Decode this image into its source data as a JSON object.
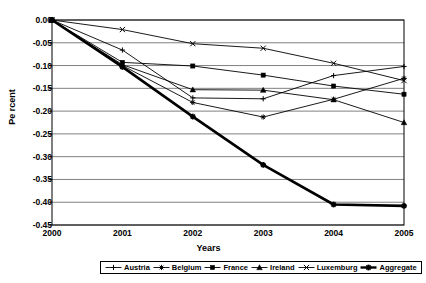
{
  "chart_data": {
    "type": "line",
    "title": "",
    "xlabel": "Years",
    "ylabel": "Pe rcent",
    "categories": [
      "2000",
      "2001",
      "2002",
      "2003",
      "2004",
      "2005"
    ],
    "x": [
      2000,
      2001,
      2002,
      2003,
      2004,
      2005
    ],
    "ylim": [
      -0.45,
      0.0
    ],
    "xlim": [
      2000,
      2005
    ],
    "ytick_labels": [
      "0.00",
      "-0.05",
      "-0.10",
      "-0.15",
      "-0.20",
      "-0.25",
      "-0.30",
      "-0.35",
      "-0.40",
      "-0.45"
    ],
    "ytick_values": [
      0.0,
      -0.05,
      -0.1,
      -0.15,
      -0.2,
      -0.25,
      -0.3,
      -0.35,
      -0.4,
      -0.45
    ],
    "grid": "horizontal",
    "legend_position": "bottom",
    "series": [
      {
        "name": "Austria",
        "marker": "plus",
        "values": [
          0.0,
          -0.066,
          -0.171,
          -0.173,
          -0.122,
          -0.102
        ]
      },
      {
        "name": "Belgium",
        "marker": "asterisk",
        "values": [
          0.0,
          -0.1,
          -0.181,
          -0.213,
          -0.174,
          -0.128
        ]
      },
      {
        "name": "France",
        "marker": "square",
        "values": [
          0.0,
          -0.093,
          -0.101,
          -0.121,
          -0.145,
          -0.163
        ]
      },
      {
        "name": "Ireland",
        "marker": "triangle",
        "values": [
          0.0,
          -0.098,
          -0.153,
          -0.154,
          -0.175,
          -0.225
        ]
      },
      {
        "name": "Luxemburg",
        "marker": "cross",
        "values": [
          0.0,
          -0.021,
          -0.052,
          -0.062,
          -0.095,
          -0.133
        ]
      },
      {
        "name": "Aggregate",
        "marker": "bold-asterisk",
        "values": [
          0.0,
          -0.103,
          -0.212,
          -0.318,
          -0.405,
          -0.408
        ]
      }
    ]
  },
  "legend": {
    "items": [
      {
        "label": "Austria"
      },
      {
        "label": "Belgium"
      },
      {
        "label": "France"
      },
      {
        "label": "Ireland"
      },
      {
        "label": "Luxemburg"
      },
      {
        "label": "Aggregate"
      }
    ]
  },
  "colors": {
    "line": "#000000",
    "grid": "#808080",
    "axis": "#000000",
    "background": "#ffffff"
  }
}
